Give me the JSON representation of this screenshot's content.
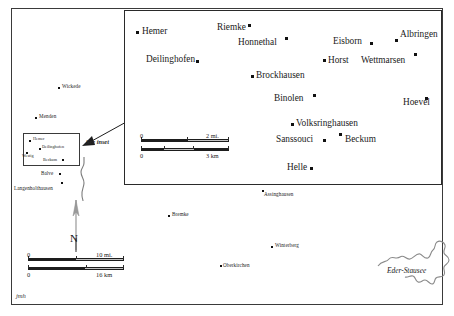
{
  "map": {
    "title": "Sauerland region reference map with Hemer detail inset",
    "signature": "jmh",
    "annotations": {
      "see_inset": "See inset"
    },
    "north_arrow": {
      "letter": "N",
      "name": "north-arrow"
    },
    "colors": {
      "frame": "#3a3a3a",
      "inset_frame": "#2a2a2a",
      "point": "#111111",
      "text": "#1a1a1a",
      "water": "#8a8a8a",
      "scalebar_dark": "#1d1d1d",
      "scalebar_light": "#c2c2c2",
      "background": "#ffffff"
    }
  },
  "overview": {
    "places": [
      {
        "name": "Wickede",
        "label_x": 62,
        "label_y": 84,
        "dot_x": 58,
        "dot_y": 87,
        "anchor": "left"
      },
      {
        "name": "Menden",
        "label_x": 39,
        "label_y": 114,
        "dot_x": 35,
        "dot_y": 117,
        "anchor": "left"
      },
      {
        "name": "Balve",
        "label_x": 41,
        "label_y": 171,
        "dot_x": 59,
        "dot_y": 173,
        "anchor": "left"
      },
      {
        "name": "Langenholthausen",
        "label_x": 14,
        "label_y": 186,
        "dot_x": 61,
        "dot_y": 182,
        "anchor": "left"
      },
      {
        "name": "Assinghausen",
        "label_x": 264,
        "label_y": 192,
        "dot_x": 262,
        "dot_y": 190,
        "anchor": "left"
      },
      {
        "name": "Bremke",
        "label_x": 172,
        "label_y": 212,
        "dot_x": 168,
        "dot_y": 215,
        "anchor": "left"
      },
      {
        "name": "Winterberg",
        "label_x": 275,
        "label_y": 243,
        "dot_x": 271,
        "dot_y": 246,
        "anchor": "left"
      },
      {
        "name": "Oberkirchen",
        "label_x": 223,
        "label_y": 263,
        "dot_x": 220,
        "dot_y": 265,
        "anchor": "left"
      }
    ],
    "water": [
      {
        "name": "Eder-Stausee",
        "type": "lake",
        "label": "Eder-Stausee"
      },
      {
        "name": "Hoennetal stream",
        "type": "river",
        "label": ""
      }
    ],
    "scalebar": {
      "name": "scale-bar-main",
      "miles": {
        "zero": "0",
        "end": "10 mi.",
        "max": 10,
        "unit": "mi."
      },
      "kilometers": {
        "zero": "0",
        "end": "16 km",
        "max": 16,
        "unit": "km"
      }
    }
  },
  "locator_box": {
    "name": "locator-rectangle",
    "places": [
      {
        "name": "Hemer",
        "label_x": 9,
        "label_y": 3,
        "dot_x": 5,
        "dot_y": 6
      },
      {
        "name": "Deilinghofen",
        "label_x": 18,
        "label_y": 11,
        "dot_x": 15,
        "dot_y": 14
      },
      {
        "name": "Westig",
        "label_x": -2,
        "label_y": 20,
        "dot_x": 2,
        "dot_y": 18
      },
      {
        "name": "Beckum",
        "label_x": 19,
        "label_y": 24,
        "dot_x": 38,
        "dot_y": 25
      }
    ]
  },
  "inset": {
    "name": "detail-inset-map",
    "places": [
      {
        "name": "Hemer",
        "label_x": 17,
        "label_y": 16,
        "dot_x": 11,
        "dot_y": 20
      },
      {
        "name": "Riemke",
        "label_x": 92,
        "label_y": 12,
        "dot_x": 123,
        "dot_y": 13
      },
      {
        "name": "Honnethal",
        "label_x": 113,
        "label_y": 27,
        "dot_x": 160,
        "dot_y": 26
      },
      {
        "name": "Eisborn",
        "label_x": 208,
        "label_y": 26,
        "dot_x": 245,
        "dot_y": 31
      },
      {
        "name": "Albringen",
        "label_x": 275,
        "label_y": 19,
        "dot_x": 270,
        "dot_y": 28
      },
      {
        "name": "Deilinghofen",
        "label_x": 21,
        "label_y": 44,
        "dot_x": 71,
        "dot_y": 49
      },
      {
        "name": "Horst",
        "label_x": 203,
        "label_y": 45,
        "dot_x": 198,
        "dot_y": 48
      },
      {
        "name": "Wettmarsen",
        "label_x": 236,
        "label_y": 45,
        "dot_x": 289,
        "dot_y": 42
      },
      {
        "name": "Brockhausen",
        "label_x": 131,
        "label_y": 60,
        "dot_x": 126,
        "dot_y": 64
      },
      {
        "name": "Binolen",
        "label_x": 149,
        "label_y": 83,
        "dot_x": 188,
        "dot_y": 83
      },
      {
        "name": "Hoevel",
        "label_x": 278,
        "label_y": 87,
        "dot_x": 300,
        "dot_y": 86
      },
      {
        "name": "Volksringhausen",
        "label_x": 171,
        "label_y": 108,
        "dot_x": 166,
        "dot_y": 112
      },
      {
        "name": "Sanssouci",
        "label_x": 151,
        "label_y": 124,
        "dot_x": 198,
        "dot_y": 128
      },
      {
        "name": "Beckum",
        "label_x": 220,
        "label_y": 124,
        "dot_x": 214,
        "dot_y": 122
      },
      {
        "name": "Helle",
        "label_x": 162,
        "label_y": 152,
        "dot_x": 185,
        "dot_y": 156
      }
    ],
    "scalebar": {
      "name": "scale-bar-inset",
      "miles": {
        "zero": "0",
        "end": "2 mi.",
        "max": 2,
        "unit": "mi."
      },
      "kilometers": {
        "zero": "0",
        "end": "3 km",
        "max": 3,
        "unit": "km"
      }
    }
  }
}
